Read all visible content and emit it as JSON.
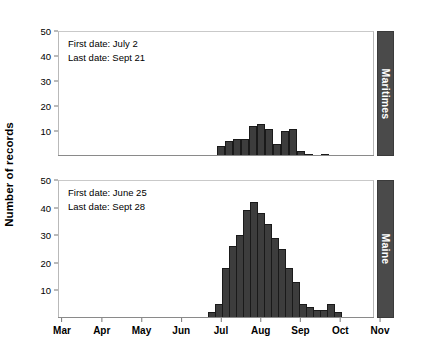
{
  "figure": {
    "width": 435,
    "height": 349,
    "bar_color": "#3d3d3d",
    "bar_edge_color": "#1a1a1a",
    "strip_color": "#4a4a4a",
    "strip_text_color": "#ffffff"
  },
  "axis": {
    "ylabel": "Number of records",
    "yticks": [
      10,
      20,
      30,
      40,
      50
    ],
    "ylim": [
      0,
      50
    ],
    "xticks": [
      "Mar",
      "Apr",
      "May",
      "Jun",
      "Jul",
      "Aug",
      "Sep",
      "Oct",
      "Nov"
    ],
    "xlabel": ""
  },
  "chart_data": {
    "type": "bar",
    "title": "",
    "xlabel": "",
    "ylabel": "Number of records",
    "ylim": [
      0,
      50
    ],
    "grid": false,
    "legend": "none",
    "axis_note": "Two stacked histogram panels (facets) sharing a monthly x axis from Mar to Nov; bars are weekly bins.",
    "categories": [
      "Mar",
      "Apr",
      "May",
      "Jun",
      "Jul",
      "Aug",
      "Sep",
      "Oct",
      "Nov"
    ],
    "panels": [
      {
        "name": "Maritimes",
        "first_date": "July 2",
        "last_date": "Sept 21",
        "bins": [
          {
            "x": 221,
            "value": 4
          },
          {
            "x": 229,
            "value": 6
          },
          {
            "x": 237,
            "value": 7
          },
          {
            "x": 245,
            "value": 7
          },
          {
            "x": 253,
            "value": 12
          },
          {
            "x": 261,
            "value": 13
          },
          {
            "x": 269,
            "value": 11
          },
          {
            "x": 277,
            "value": 5
          },
          {
            "x": 285,
            "value": 10
          },
          {
            "x": 293,
            "value": 11
          },
          {
            "x": 301,
            "value": 2
          },
          {
            "x": 309,
            "value": 1
          },
          {
            "x": 325,
            "value": 1
          }
        ]
      },
      {
        "name": "Maine",
        "first_date": "June 25",
        "last_date": "Sept 28",
        "bins": [
          {
            "x": 212,
            "value": 2
          },
          {
            "x": 219,
            "value": 5
          },
          {
            "x": 226,
            "value": 18
          },
          {
            "x": 233,
            "value": 26
          },
          {
            "x": 240,
            "value": 30
          },
          {
            "x": 247,
            "value": 39
          },
          {
            "x": 254,
            "value": 42
          },
          {
            "x": 261,
            "value": 38
          },
          {
            "x": 268,
            "value": 34
          },
          {
            "x": 275,
            "value": 29
          },
          {
            "x": 282,
            "value": 25
          },
          {
            "x": 289,
            "value": 18
          },
          {
            "x": 296,
            "value": 13
          },
          {
            "x": 303,
            "value": 5
          },
          {
            "x": 310,
            "value": 4
          },
          {
            "x": 317,
            "value": 3
          },
          {
            "x": 324,
            "value": 3
          },
          {
            "x": 331,
            "value": 5
          },
          {
            "x": 338,
            "value": 2
          }
        ]
      }
    ]
  },
  "panel_labels": {
    "top": "Maritimes",
    "bottom": "Maine"
  },
  "annotations": {
    "top": {
      "line1": "First date: July 2",
      "line2": "Last date: Sept 21"
    },
    "bottom": {
      "line1": "First date: June 25",
      "line2": "Last date: Sept 28"
    }
  }
}
